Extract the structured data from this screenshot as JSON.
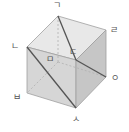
{
  "diagram": {
    "type": "cube",
    "colors": {
      "top_face": "#e6e6e6",
      "front_face": "#d4d4d4",
      "right_face": "#c4c4c4",
      "edge": "#9a9a9a",
      "hidden_edge": "#b0b0b0",
      "diagonal": "#555555",
      "label": "#555555"
    },
    "vertices": [
      {
        "id": "giyeok",
        "label": "ㄱ",
        "x": 58,
        "y": 16,
        "lx": 57,
        "ly": 5
      },
      {
        "id": "rieul",
        "label": "ㄹ",
        "x": 106,
        "y": 30,
        "lx": 114,
        "ly": 30
      },
      {
        "id": "nieun",
        "label": "ㄴ",
        "x": 27,
        "y": 47,
        "lx": 15,
        "ly": 46
      },
      {
        "id": "digeut",
        "label": "ㄷ",
        "x": 76,
        "y": 60,
        "lx": 73,
        "ly": 52
      },
      {
        "id": "mieum",
        "label": "ㅁ",
        "x": 58,
        "y": 62,
        "lx": 50,
        "ly": 59
      },
      {
        "id": "ieung",
        "label": "ㅇ",
        "x": 106,
        "y": 77,
        "lx": 115,
        "ly": 78
      },
      {
        "id": "bieup",
        "label": "ㅂ",
        "x": 27,
        "y": 93,
        "lx": 17,
        "ly": 97
      },
      {
        "id": "siot",
        "label": "ㅅ",
        "x": 76,
        "y": 108,
        "lx": 76,
        "ly": 119
      }
    ],
    "diagonals": [
      {
        "from": "ㄱ",
        "to": "ㄷ"
      },
      {
        "from": "ㄷ",
        "to": "ㅇ"
      },
      {
        "from": "ㄴ",
        "to": "ㅅ"
      }
    ]
  }
}
